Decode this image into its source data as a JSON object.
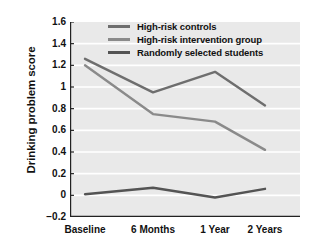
{
  "chart_data": {
    "type": "line",
    "title": "",
    "xlabel": "",
    "ylabel": "Drinking problem score",
    "categories": [
      "Baseline",
      "6 Months",
      "1 Year",
      "2 Years"
    ],
    "ylim": [
      -0.2,
      1.6
    ],
    "yticks": [
      "1.6",
      "1.4",
      "1.2",
      "1",
      "0.8",
      "0.6",
      "0.4",
      "0.2",
      "0",
      "−0.2"
    ],
    "ytick_values": [
      1.6,
      1.4,
      1.2,
      1.0,
      0.8,
      0.6,
      0.4,
      0.2,
      0.0,
      -0.2
    ],
    "grid": true,
    "legend_position": "top-right-inside",
    "series": [
      {
        "name": "High-risk controls",
        "values": [
          1.26,
          0.95,
          1.14,
          0.83
        ],
        "color": "#6e6e6e"
      },
      {
        "name": "High-risk intervention group",
        "values": [
          1.2,
          0.75,
          0.68,
          0.42
        ],
        "color": "#8a8a8a"
      },
      {
        "name": "Randomly selected students",
        "values": [
          0.01,
          0.07,
          -0.02,
          0.06
        ],
        "color": "#545454"
      }
    ]
  },
  "style": {
    "plot_background": "#e9e9e9",
    "gridline_color": "#ffffff",
    "axis_color": "#222222",
    "text_color": "#111111"
  }
}
